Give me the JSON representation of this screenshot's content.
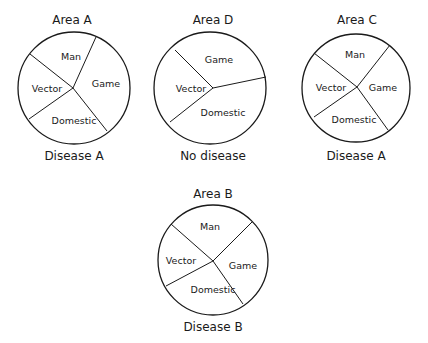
{
  "diagrams": [
    {
      "title": "Area A",
      "caption": "Disease A",
      "slices": [
        "Man",
        "Game",
        "Vector",
        "Domestic"
      ]
    },
    {
      "title": "Area D",
      "caption": "No disease",
      "slices": [
        "Game",
        "Vector",
        "Domestic"
      ]
    },
    {
      "title": "Area C",
      "caption": "Disease A",
      "slices": [
        "Man",
        "Vector",
        "Game",
        "Domestic"
      ]
    },
    {
      "title": "Area B",
      "caption": "Disease B",
      "slices": [
        "Man",
        "Vector",
        "Game",
        "Domestic"
      ]
    }
  ],
  "colors": {
    "ink": "#1a1a1a",
    "background": "#ffffff"
  }
}
